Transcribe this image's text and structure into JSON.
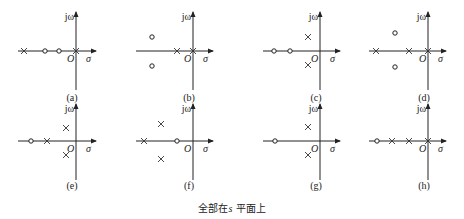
{
  "caption": {
    "prefix": "全部在",
    "var": "s",
    "suffix": " 平面上"
  },
  "axis_labels": {
    "imag": "jω",
    "real": "σ",
    "origin": "O"
  },
  "panels": [
    {
      "id": "a",
      "label": "(a)",
      "ox": 76,
      "oy": 51,
      "xl": 18,
      "xr": 96,
      "yt": 12,
      "yb": 90,
      "ly": 101,
      "poles": [
        [
          -52,
          0
        ],
        [
          0,
          0
        ]
      ],
      "zeros": [
        [
          -31,
          0
        ],
        [
          -17,
          0
        ]
      ]
    },
    {
      "id": "b",
      "label": "(b)",
      "ox": 193,
      "oy": 51,
      "xl": 136,
      "xr": 213,
      "yt": 12,
      "yb": 90,
      "ly": 101,
      "poles": [
        [
          -16,
          0
        ],
        [
          0,
          0
        ]
      ],
      "zeros": [
        [
          -41,
          -14
        ],
        [
          -41,
          15
        ]
      ]
    },
    {
      "id": "c",
      "label": "(c)",
      "ox": 320,
      "oy": 51,
      "xl": 263,
      "xr": 340,
      "yt": 12,
      "yb": 90,
      "ly": 101,
      "poles": [
        [
          -12,
          -14
        ],
        [
          -12,
          14
        ]
      ],
      "zeros": [
        [
          -46,
          0
        ],
        [
          -30,
          0
        ]
      ]
    },
    {
      "id": "d",
      "label": "(d)",
      "ox": 428,
      "oy": 51,
      "xl": 369,
      "xr": 446,
      "yt": 12,
      "yb": 90,
      "ly": 101,
      "poles": [
        [
          -52,
          0
        ],
        [
          -19,
          0
        ],
        [
          0,
          0
        ]
      ],
      "zeros": [
        [
          -33,
          -18
        ],
        [
          -33,
          16
        ]
      ]
    },
    {
      "id": "e",
      "label": "(e)",
      "ox": 76,
      "oy": 141,
      "xl": 18,
      "xr": 96,
      "yt": 104,
      "yb": 180,
      "ly": 189,
      "poles": [
        [
          -10,
          -13
        ],
        [
          -10,
          14
        ],
        [
          -29,
          0
        ]
      ],
      "zeros": [
        [
          -45,
          0
        ]
      ]
    },
    {
      "id": "f",
      "label": "(f)",
      "ox": 193,
      "oy": 141,
      "xl": 136,
      "xr": 213,
      "yt": 104,
      "yb": 180,
      "ly": 189,
      "poles": [
        [
          -32,
          -17
        ],
        [
          -32,
          18
        ],
        [
          -49,
          0
        ]
      ],
      "zeros": [
        [
          -16,
          0
        ]
      ]
    },
    {
      "id": "g",
      "label": "(g)",
      "ox": 320,
      "oy": 141,
      "xl": 263,
      "xr": 340,
      "yt": 104,
      "yb": 180,
      "ly": 189,
      "poles": [
        [
          -12,
          -14
        ],
        [
          -12,
          14
        ]
      ],
      "zeros": [
        [
          -45,
          0
        ]
      ]
    },
    {
      "id": "h",
      "label": "(h)",
      "ox": 428,
      "oy": 141,
      "xl": 369,
      "xr": 446,
      "yt": 104,
      "yb": 180,
      "ly": 189,
      "poles": [
        [
          -36,
          0
        ],
        [
          -19,
          0
        ],
        [
          0,
          0
        ]
      ],
      "zeros": [
        [
          -51,
          0
        ]
      ]
    }
  ]
}
